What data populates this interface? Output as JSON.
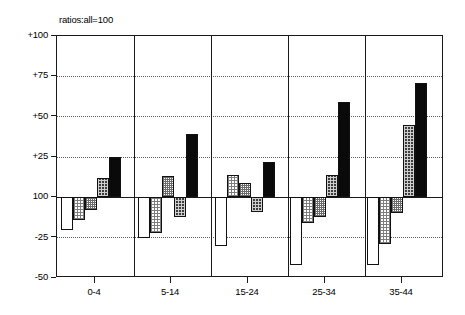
{
  "chart_data": {
    "type": "bar",
    "title": "ratios:all=100",
    "xlabel": "",
    "ylabel": "",
    "ylim": [
      -50,
      100
    ],
    "baseline": 0,
    "baseline_label": "100",
    "grid": true,
    "legend_position": "none",
    "categories": [
      "0-4",
      "5-14",
      "15-24",
      "25-34",
      "35-44"
    ],
    "ytick_labels": [
      "+100",
      "+75",
      "+50",
      "+25",
      "100",
      "-25",
      "-50"
    ],
    "ytick_values": [
      100,
      75,
      50,
      25,
      0,
      -25,
      -50
    ],
    "series": [
      {
        "name": "series-1",
        "fill": "white",
        "values": [
          -20,
          -25,
          -30,
          -42,
          -42
        ]
      },
      {
        "name": "series-2",
        "fill": "light-hatch",
        "values": [
          -14,
          -22,
          14,
          -16,
          -29
        ]
      },
      {
        "name": "series-3",
        "fill": "mid-hatch",
        "values": [
          -8,
          13,
          9,
          -12,
          -10
        ]
      },
      {
        "name": "series-4",
        "fill": "dark-hatch",
        "values": [
          12,
          -12,
          -9,
          14,
          45
        ]
      },
      {
        "name": "series-5",
        "fill": "black",
        "values": [
          25,
          39,
          22,
          59,
          71
        ]
      }
    ]
  },
  "layout": {
    "plot_left": 56,
    "plot_top": 35,
    "plot_width": 387,
    "plot_height": 242,
    "bar_width": 12,
    "group_width": 60,
    "group_offsets": [
      4,
      81,
      158,
      233,
      310
    ],
    "separator_positions": [
      77,
      154,
      231,
      308
    ],
    "category_centers": [
      38,
      114,
      191,
      268,
      345
    ]
  }
}
